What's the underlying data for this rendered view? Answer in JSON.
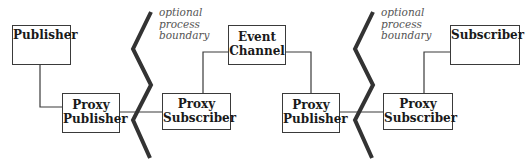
{
  "diagram": {
    "nodes": [
      {
        "id": "publisher",
        "lines": [
          "Publisher"
        ]
      },
      {
        "id": "proxy-publisher-1",
        "lines": [
          "Proxy",
          "Publisher"
        ]
      },
      {
        "id": "proxy-subscriber-1",
        "lines": [
          "Proxy",
          "Subscriber"
        ]
      },
      {
        "id": "event-channel",
        "lines": [
          "Event",
          "Channel"
        ]
      },
      {
        "id": "proxy-publisher-2",
        "lines": [
          "Proxy",
          "Publisher"
        ]
      },
      {
        "id": "proxy-subscriber-2",
        "lines": [
          "Proxy",
          "Subscriber"
        ]
      },
      {
        "id": "subscriber",
        "lines": [
          "Subscriber"
        ]
      }
    ],
    "boundaries": [
      {
        "lines": [
          "optional",
          "process",
          "boundary"
        ]
      },
      {
        "lines": [
          "optional",
          "process",
          "boundary"
        ]
      }
    ],
    "edges": [
      [
        "publisher",
        "proxy-publisher-1"
      ],
      [
        "proxy-publisher-1",
        "proxy-subscriber-1"
      ],
      [
        "proxy-subscriber-1",
        "event-channel"
      ],
      [
        "event-channel",
        "proxy-publisher-2"
      ],
      [
        "proxy-publisher-2",
        "proxy-subscriber-2"
      ],
      [
        "proxy-subscriber-2",
        "subscriber"
      ]
    ],
    "colors": {
      "line": "#3a3a3a",
      "boundary": "#333333",
      "note": "#555555"
    }
  }
}
